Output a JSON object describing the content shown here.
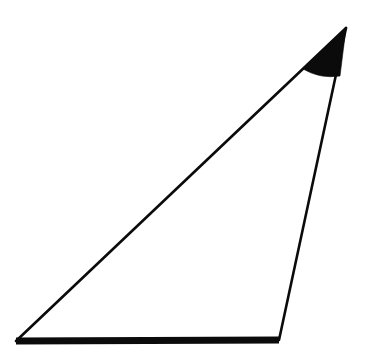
{
  "figure": {
    "background_color": "#ffffff",
    "stroke_color": "#0b0b0b",
    "fill_color": "#ffffff",
    "canvas": {
      "width": 373,
      "height": 360
    }
  },
  "chart_data": {
    "type": "diagram",
    "shape": "triangle",
    "vertices": [
      {
        "name": "A",
        "role": "bottom-left",
        "x": 16,
        "y": 341
      },
      {
        "name": "B",
        "role": "bottom-right",
        "x": 279,
        "y": 340
      },
      {
        "name": "C",
        "role": "apex",
        "x": 346,
        "y": 28
      }
    ],
    "edges": [
      {
        "name": "base",
        "from": "A",
        "to": "B",
        "style": "bold",
        "stroke_width": 7
      },
      {
        "name": "right-leg",
        "from": "B",
        "to": "C",
        "style": "thin",
        "stroke_width": 2.6
      },
      {
        "name": "hypotenuse",
        "from": "A",
        "to": "C",
        "style": "thin",
        "stroke_width": 2.6
      }
    ],
    "angle_markers": [
      {
        "at_vertex": "C",
        "style": "filled-sector",
        "fill": "#0b0b0b",
        "radius": 48,
        "start_point": {
          "x": 303,
          "y": 69
        },
        "end_point": {
          "x": 340,
          "y": 76
        }
      }
    ],
    "grid": false,
    "axes": false,
    "legend": false,
    "labels": []
  }
}
